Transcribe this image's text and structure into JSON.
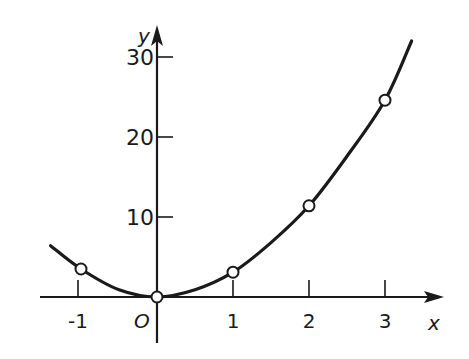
{
  "chart_data": {
    "type": "line",
    "title": "",
    "xlabel": "x",
    "ylabel": "y",
    "origin_label": "O",
    "xlim": [
      -1.5,
      3.75
    ],
    "ylim": [
      -6,
      34
    ],
    "grid": false,
    "legend": null,
    "x_ticks": [
      -1,
      1,
      2,
      3
    ],
    "x_tick_labels": [
      "-1",
      "1",
      "2",
      "3"
    ],
    "y_ticks": [
      10,
      20,
      30
    ],
    "y_tick_labels": [
      "10",
      "20",
      "30"
    ],
    "series": [
      {
        "name": "curve",
        "style": "solid",
        "x": [
          -1.4,
          -1,
          -0.5,
          0,
          0.5,
          1,
          1.5,
          2,
          2.5,
          3,
          3.35
        ],
        "y": [
          6.4,
          3.5,
          0.9,
          0,
          0.9,
          3.1,
          6.8,
          11.4,
          17.6,
          24.6,
          32
        ]
      }
    ],
    "markers": {
      "style": "open-circle",
      "x": [
        -1,
        0,
        1,
        2,
        3
      ],
      "y": [
        3.5,
        0,
        3.1,
        11.4,
        24.6
      ]
    }
  },
  "colors": {
    "ink": "#1a1a1a",
    "background": "#ffffff"
  }
}
